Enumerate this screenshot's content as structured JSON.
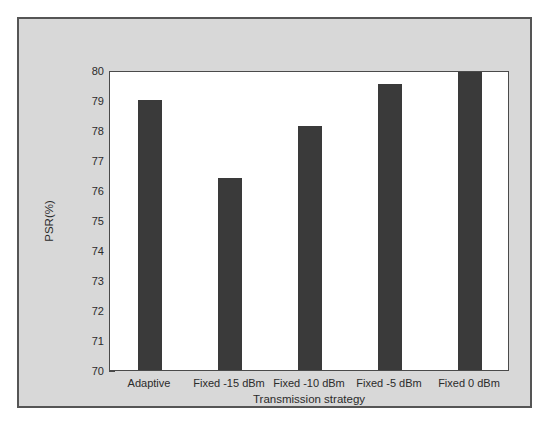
{
  "chart_data": {
    "type": "bar",
    "title": "",
    "subtitle": "",
    "categories": [
      "Adaptive",
      "Fixed -15 dBm",
      "Fixed -10 dBm",
      "Fixed -5 dBm",
      "Fixed 0 dBm"
    ],
    "values": [
      79.0,
      76.4,
      78.15,
      79.55,
      79.95
    ],
    "xlabel": "Transmission strategy",
    "ylabel": "PSR(%)",
    "ylim": [
      70,
      80
    ],
    "yticks": [
      70,
      71,
      72,
      73,
      74,
      75,
      76,
      77,
      78,
      79,
      80
    ],
    "ytick_labels": [
      "70",
      "71",
      "72",
      "73",
      "74",
      "75",
      "76",
      "77",
      "78",
      "79",
      "80"
    ],
    "grid": false,
    "legend": null,
    "bar_color": "#3a3a3a",
    "plot_background": "#ffffff",
    "figure_background": "#d8d8d8",
    "axis_color": "#4a4a4a"
  }
}
